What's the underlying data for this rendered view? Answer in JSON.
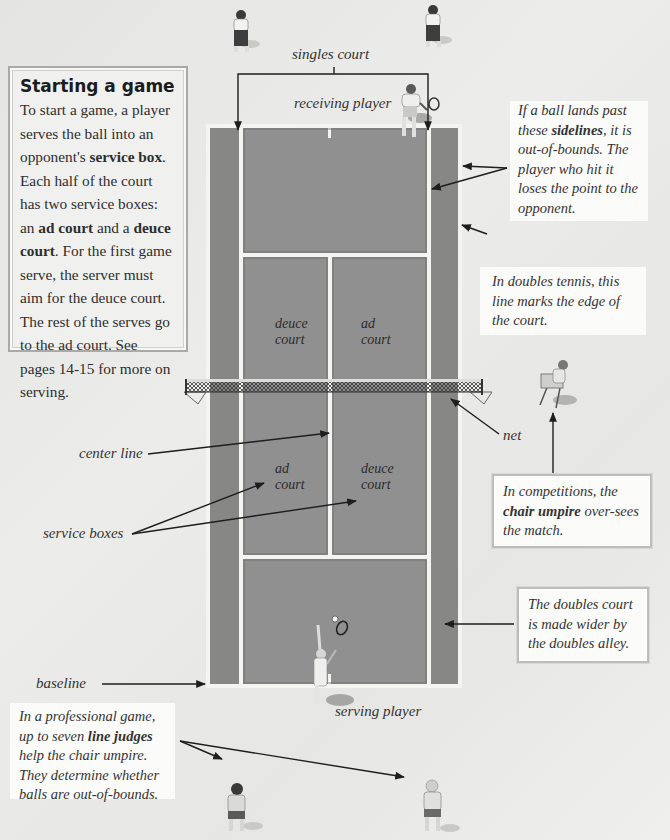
{
  "info_box": {
    "title": "Starting a game",
    "p1": "To start a game, a player serves the ball into an opponent's ",
    "p1_bold": "service box",
    "p2": ". Each half of the court has two service boxes: an ",
    "p2_bold": "ad court",
    "p3": " and a ",
    "p3_bold": "deuce court",
    "p4": ". For the first game serve, the server must aim for the deuce court. The rest of the serves go to the ad court. See pages 14-15 for more on serving."
  },
  "labels": {
    "singles_court": "singles court",
    "receiving_player": "receiving player",
    "serving_player": "serving player",
    "center_line": "center line",
    "service_boxes": "service boxes",
    "baseline": "baseline",
    "net": "net"
  },
  "court_labels": {
    "top_left": [
      "deuce",
      "court"
    ],
    "top_right": [
      "ad",
      "court"
    ],
    "bottom_left": [
      "ad",
      "court"
    ],
    "bottom_right": [
      "deuce",
      "court"
    ]
  },
  "callouts": {
    "sidelines": {
      "pre": "If a ball lands past these ",
      "bold": "sidelines",
      "post": ", it is out-of-bounds. The player who hit it loses the point to the opponent."
    },
    "doubles_edge": "In doubles tennis, this line marks the edge of the court.",
    "chair_umpire": {
      "pre": "In competitions, the ",
      "bold": "chair umpire",
      "post": " over-sees the match."
    },
    "doubles_alley": "The doubles court is made wider by the doubles alley.",
    "line_judges": {
      "pre": "In a professional game, up to seven ",
      "bold": "line judges",
      "post": " help the chair umpire. They determine whether balls are out-of-bounds."
    }
  },
  "colors": {
    "court": "#8a8a88",
    "alley": "#858583",
    "lines": "#f4f4f2",
    "background": "#e8e8e6",
    "arrow": "#1e1e1e"
  }
}
